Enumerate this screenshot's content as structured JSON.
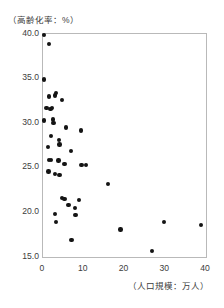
{
  "chart_data": {
    "type": "scatter",
    "title": "",
    "ylabel": "（高齢化率：%）",
    "xlabel": "（人口規模：万人）",
    "xlim": [
      0,
      40
    ],
    "ylim": [
      15.0,
      40.0
    ],
    "xticks": [
      "0",
      "10",
      "20",
      "30",
      "40"
    ],
    "xtick_values": [
      0,
      10,
      20,
      30,
      40
    ],
    "yticks": [
      "40.0",
      "35.0",
      "30.0",
      "25.0",
      "20.0",
      "15.0"
    ],
    "ytick_values": [
      40.0,
      35.0,
      30.0,
      25.0,
      20.0,
      15.0
    ],
    "grid": false,
    "legend": null,
    "marker_color": "#141414",
    "frame_color": "#b9b9b9",
    "series": [
      {
        "name": "市区町村",
        "points": [
          [
            0.2,
            39.9
          ],
          [
            1.5,
            38.9
          ],
          [
            0.3,
            34.9
          ],
          [
            1.4,
            33.0
          ],
          [
            2.9,
            33.1
          ],
          [
            3.2,
            33.4
          ],
          [
            4.6,
            32.6
          ],
          [
            0.9,
            31.7
          ],
          [
            1.8,
            31.6
          ],
          [
            2.2,
            31.7
          ],
          [
            0.2,
            30.3
          ],
          [
            2.5,
            30.4
          ],
          [
            2.6,
            30.0
          ],
          [
            5.7,
            29.5
          ],
          [
            9.3,
            29.2
          ],
          [
            2.0,
            28.6
          ],
          [
            3.9,
            28.1
          ],
          [
            4.0,
            27.6
          ],
          [
            1.2,
            27.3
          ],
          [
            6.8,
            26.9
          ],
          [
            1.4,
            25.9
          ],
          [
            2.0,
            25.9
          ],
          [
            3.8,
            25.8
          ],
          [
            5.3,
            25.4
          ],
          [
            9.4,
            25.3
          ],
          [
            10.6,
            25.3
          ],
          [
            1.3,
            24.6
          ],
          [
            3.0,
            24.3
          ],
          [
            4.0,
            24.2
          ],
          [
            16.0,
            23.2
          ],
          [
            4.6,
            21.6
          ],
          [
            5.3,
            21.5
          ],
          [
            8.8,
            21.4
          ],
          [
            6.3,
            20.8
          ],
          [
            7.8,
            20.5
          ],
          [
            3.0,
            19.8
          ],
          [
            8.0,
            19.7
          ],
          [
            3.2,
            18.9
          ],
          [
            29.7,
            18.9
          ],
          [
            38.8,
            18.6
          ],
          [
            19.0,
            18.1
          ],
          [
            7.0,
            16.9
          ],
          [
            26.8,
            15.7
          ]
        ]
      }
    ]
  }
}
